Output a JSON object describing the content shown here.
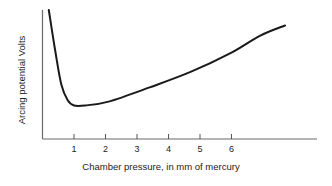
{
  "chart_data": {
    "type": "line",
    "title": "",
    "xlabel": "Chamber pressure, in mm of mercury",
    "ylabel": "Arcing potential Volts",
    "xlim": [
      0,
      8.8
    ],
    "ylim": [
      0,
      100
    ],
    "x_ticks": [
      1,
      2,
      3,
      4,
      5,
      6
    ],
    "x_tick_labels": [
      "1",
      "2",
      "3",
      "4",
      "5",
      "6"
    ],
    "y_ticks": [],
    "grid": false,
    "legend": null,
    "series": [
      {
        "name": "Arcing potential",
        "color": "#1a1a1a",
        "x": [
          0.2,
          0.4,
          0.6,
          0.8,
          1.0,
          1.35,
          2.1,
          3.4,
          4.7,
          6.0,
          6.9,
          7.7
        ],
        "y": [
          100,
          69,
          42,
          30,
          26,
          26,
          29,
          40,
          52,
          67,
          80,
          88
        ]
      }
    ]
  }
}
